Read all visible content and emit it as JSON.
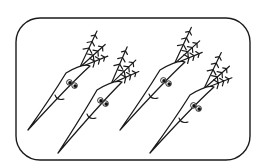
{
  "illustration": {
    "subject": "four cartoon carrots with smiling faces",
    "frame": {
      "x": 16,
      "y": 18,
      "width": 234,
      "height": 142,
      "radius": 24,
      "stroke": "#1a1a1a"
    },
    "carrots": [
      {
        "tip": [
          28,
          130
        ],
        "topLeft": [
          66,
          73
        ],
        "topRight": [
          90,
          66
        ],
        "eyeCenter": [
          72,
          84
        ],
        "mouth": [
          58,
          98
        ]
      },
      {
        "tip": [
          58,
          153
        ],
        "topLeft": [
          97,
          90
        ],
        "topRight": [
          122,
          82
        ],
        "eyeCenter": [
          103,
          102
        ],
        "mouth": [
          90,
          117
        ]
      },
      {
        "tip": [
          120,
          130
        ],
        "topLeft": [
          160,
          70
        ],
        "topRight": [
          185,
          62
        ],
        "eyeCenter": [
          166,
          82
        ],
        "mouth": [
          152,
          97
        ]
      },
      {
        "tip": [
          150,
          153
        ],
        "topLeft": [
          190,
          95
        ],
        "topRight": [
          214,
          87
        ],
        "eyeCenter": [
          196,
          107
        ],
        "mouth": [
          182,
          121
        ]
      }
    ],
    "colors": {
      "line": "#1a1a1a",
      "background": "#ffffff"
    }
  }
}
